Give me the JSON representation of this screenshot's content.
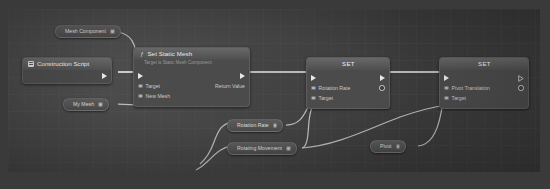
{
  "app": {
    "title": "Blueprint Event Graph",
    "canvas_bg": "#404040",
    "wire_color": "#e2e2e2"
  },
  "graph": {
    "nodes": [
      {
        "id": "mesh-component",
        "kind": "variable-get",
        "title": "Mesh Component",
        "pin_out": "object-pin"
      },
      {
        "id": "construction-script",
        "kind": "event",
        "title": "Construction Script",
        "icon": "script-icon",
        "pin_out": "exec-pin"
      },
      {
        "id": "my-mesh",
        "kind": "variable-get",
        "title": "My Mesh",
        "pin_out": "object-pin"
      },
      {
        "id": "set-static-mesh",
        "kind": "function-call",
        "title": "Set Static Mesh",
        "subtitle": "Target is Static Mesh Component",
        "inputs": [
          "Target",
          "New Mesh"
        ],
        "outputs": [
          "Return Value"
        ]
      },
      {
        "id": "set-rotation-rate",
        "kind": "setter",
        "title": "SET",
        "inputs": [
          "Rotation Rate",
          "Target"
        ],
        "outputs": [
          ""
        ]
      },
      {
        "id": "set-pivot-translation",
        "kind": "setter",
        "title": "SET",
        "inputs": [
          "Pivot Translation",
          "Target"
        ],
        "outputs": [
          ""
        ]
      },
      {
        "id": "rotation-rate-var",
        "kind": "variable-get",
        "title": "Rotation Rate",
        "pin_out": "struct-pin"
      },
      {
        "id": "rotating-movement-var",
        "kind": "variable-get",
        "title": "Rotating Movement",
        "pin_out": "object-pin"
      },
      {
        "id": "pivot-var",
        "kind": "variable-get",
        "title": "Pivot",
        "pin_out": "struct-pin"
      }
    ],
    "labels": {
      "mesh_component": "Mesh Component",
      "construction_script": "Construction Script",
      "my_mesh": "My Mesh",
      "set_static_mesh": "Set Static Mesh",
      "set_static_mesh_sub": "Target is Static Mesh Component",
      "target": "Target",
      "new_mesh": "New Mesh",
      "return_value": "Return Value",
      "set": "SET",
      "rotation_rate": "Rotation Rate",
      "pivot_translation": "Pivot Translation",
      "rotating_movement": "Rotating Movement",
      "pivot": "Pivot"
    }
  }
}
